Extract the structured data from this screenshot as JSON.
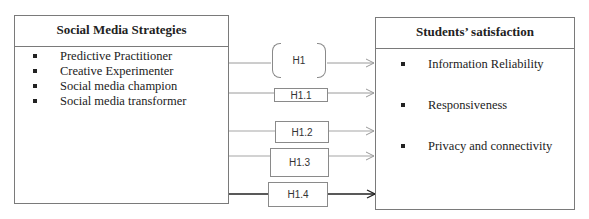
{
  "left_box": {
    "title": "Social Media Strategies",
    "items": [
      "Predictive Practitioner",
      "Creative Experimenter",
      "Social media champion",
      "Social media transformer"
    ]
  },
  "right_box": {
    "title": "Students’ satisfaction",
    "items": [
      "Information Reliability",
      "Responsiveness",
      "Privacy and connectivity"
    ]
  },
  "hypotheses": [
    {
      "label": "H1",
      "shape": "bracket"
    },
    {
      "label": "H1.1",
      "shape": "rect"
    },
    {
      "label": "H1.2",
      "shape": "rect"
    },
    {
      "label": "H1.3",
      "shape": "rect"
    },
    {
      "label": "H1.4",
      "shape": "rect"
    }
  ],
  "colors": {
    "border": "#7a7a7a",
    "light_arrow": "#9a9a9a",
    "dark_arrow": "#222222"
  }
}
